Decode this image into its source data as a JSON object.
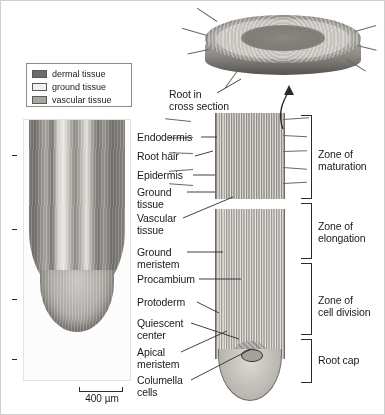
{
  "figure": {
    "background": "#ffffff"
  },
  "legend": {
    "items": [
      {
        "label": "dermal tissue",
        "color": "#6e6b68"
      },
      {
        "label": "ground tissue",
        "color": "#f2f0ee"
      },
      {
        "label": "vascular tissue",
        "color": "#a9a6a2"
      }
    ]
  },
  "micrograph": {
    "caption": "root tip light micrograph",
    "scale_bar": {
      "label": "400 µm",
      "length_px": 44
    }
  },
  "cross_section": {
    "callout": "Root in\ncross section",
    "arrow": "curved-arrow-up"
  },
  "tissue_labels": [
    {
      "name": "endodermis",
      "text": "Endodermis"
    },
    {
      "name": "root-hair",
      "text": "Root hair"
    },
    {
      "name": "epidermis",
      "text": "Epidermis"
    },
    {
      "name": "ground-tissue",
      "text": "Ground\ntissue"
    },
    {
      "name": "vascular-tissue",
      "text": "Vascular\ntissue"
    },
    {
      "name": "ground-meristem",
      "text": "Ground\nmeristem"
    },
    {
      "name": "procambium",
      "text": "Procambium"
    },
    {
      "name": "protoderm",
      "text": "Protoderm"
    },
    {
      "name": "quiescent-center",
      "text": "Quiescent\ncenter"
    },
    {
      "name": "apical-meristem",
      "text": "Apical\nmeristem"
    },
    {
      "name": "columella-cells",
      "text": "Columella\ncells"
    }
  ],
  "zones": [
    {
      "name": "zone-of-maturation",
      "text": "Zone of\nmaturation"
    },
    {
      "name": "zone-of-elongation",
      "text": "Zone of\nelongation"
    },
    {
      "name": "zone-of-cell-division",
      "text": "Zone of\ncell division"
    },
    {
      "name": "root-cap",
      "text": "Root cap"
    }
  ],
  "colors": {
    "ink": "#1a1a1a",
    "line": "#2b2b2b",
    "border": "#8c8c8c"
  }
}
